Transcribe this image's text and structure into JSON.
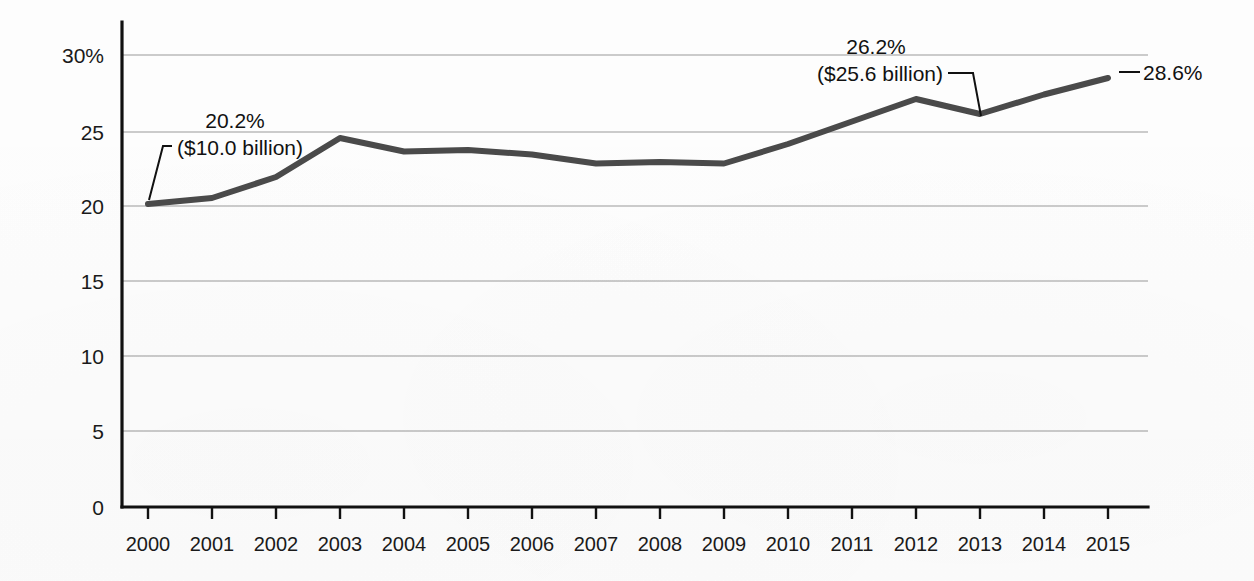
{
  "chart_data": {
    "type": "line",
    "title": "",
    "subtitle": "",
    "xlabel": "",
    "ylabel": "",
    "categories": [
      "2000",
      "2001",
      "2002",
      "2003",
      "2004",
      "2005",
      "2006",
      "2007",
      "2008",
      "2009",
      "2010",
      "2011",
      "2012",
      "2013",
      "2014",
      "2015"
    ],
    "series": [
      {
        "name": "Share of total (percent)",
        "values": [
          20.2,
          20.6,
          22.0,
          24.6,
          23.7,
          23.8,
          23.5,
          22.9,
          23.0,
          22.9,
          24.2,
          25.7,
          27.2,
          26.2,
          27.5,
          28.6
        ]
      }
    ],
    "ylim": [
      0,
      31
    ],
    "yticks": [
      0,
      5,
      10,
      15,
      20,
      25,
      30
    ],
    "ytick_labels": [
      "0",
      "5",
      "10",
      "15",
      "20",
      "25",
      "30%"
    ],
    "grid": "horizontal",
    "legend": "none",
    "line_color": "#4a4a4a",
    "gridline_color": "#9a9a9a",
    "axis_color": "#111111",
    "annotations": [
      {
        "id": "annotation-2000",
        "percent_label": "20.2%",
        "amount_label": "($10.0 billion)",
        "points_to_category": "2000",
        "points_to_value": 20.2
      },
      {
        "id": "annotation-2013",
        "percent_label": "26.2%",
        "amount_label": "($25.6 billion)",
        "points_to_category": "2013",
        "points_to_value": 26.2
      },
      {
        "id": "annotation-2015",
        "percent_label": "28.6%",
        "amount_label": "",
        "points_to_category": "2015",
        "points_to_value": 28.6
      }
    ]
  }
}
